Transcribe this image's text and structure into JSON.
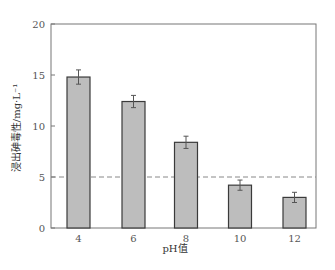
{
  "chart_data": {
    "type": "bar",
    "title": "",
    "xlabel": "pH值",
    "ylabel": "浸出砷毒性/mg·L⁻¹",
    "categories": [
      "4",
      "6",
      "8",
      "10",
      "12"
    ],
    "values": [
      14.8,
      12.4,
      8.4,
      4.2,
      3.0
    ],
    "errors": [
      0.7,
      0.6,
      0.6,
      0.5,
      0.5
    ],
    "ylim": [
      0,
      20
    ],
    "yticks": [
      "0",
      "5",
      "10",
      "15",
      "20"
    ],
    "grid": false,
    "legend": null,
    "reference_line": {
      "y": 5,
      "style": "dashed",
      "color": "#888888"
    },
    "colors": {
      "bar_fill": "#bdbdbd",
      "bar_edge": "#3a3a3a",
      "axis": "#777777",
      "error_bar": "#555555"
    }
  }
}
